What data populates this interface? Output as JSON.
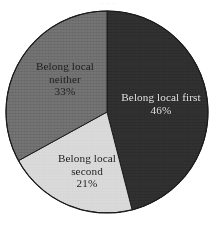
{
  "figure": {
    "background_color": "#ffffff",
    "top_cropped_text": "· · ·"
  },
  "chart_data": {
    "type": "pie",
    "title": "",
    "xlabel": "",
    "ylabel": "",
    "legend_position": "none",
    "grid": false,
    "labels_inside_slices": true,
    "start_angle_deg": 0,
    "direction": "clockwise",
    "categories": [
      "Belong local first",
      "Belong local second",
      "Belong local neither"
    ],
    "values": [
      46,
      21,
      33
    ],
    "value_unit": "%",
    "value_labels": [
      "46%",
      "21%",
      "33%"
    ],
    "colors": [
      "#2e2e2e",
      "#d8d8d8",
      "#6e6e6e"
    ],
    "slices": [
      {
        "name": "Belong local first",
        "name_line_1": "Belong local first",
        "name_line_2": "",
        "value": 46,
        "value_label": "46%",
        "color": "#2e2e2e",
        "text_color": "#e3e3e3",
        "start_deg": 0,
        "end_deg": 165.6
      },
      {
        "name": "Belong local second",
        "name_line_1": "Belong local",
        "name_line_2": "second",
        "value": 21,
        "value_label": "21%",
        "color": "#d8d8d8",
        "text_color": "#1d1d1d",
        "start_deg": 165.6,
        "end_deg": 241.2
      },
      {
        "name": "Belong local neither",
        "name_line_1": "Belong local",
        "name_line_2": "neither",
        "value": 33,
        "value_label": "33%",
        "color": "#6e6e6e",
        "text_color": "#1d1d1d",
        "start_deg": 241.2,
        "end_deg": 360
      }
    ],
    "geometry": {
      "center_x": 107,
      "center_y": 112,
      "radius": 101,
      "outline_color": "#1a1a1a"
    }
  }
}
